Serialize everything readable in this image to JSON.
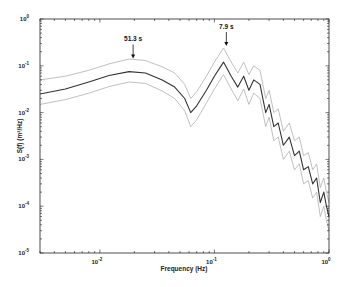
{
  "chart_data": {
    "type": "line",
    "title": "",
    "xlabel": "Frequency (Hz)",
    "ylabel": "S(f) (m²/Hz)",
    "xscale": "log",
    "yscale": "log",
    "xlim": [
      0.003,
      1
    ],
    "ylim": [
      1e-05,
      1
    ],
    "grid": false,
    "x_ticks": [
      {
        "value": 0.01,
        "base": "10",
        "exp": "-2"
      },
      {
        "value": 0.1,
        "base": "10",
        "exp": "-1"
      },
      {
        "value": 1,
        "base": "10",
        "exp": "0"
      }
    ],
    "y_ticks": [
      {
        "value": 1,
        "base": "10",
        "exp": "0"
      },
      {
        "value": 0.1,
        "base": "10",
        "exp": "-1"
      },
      {
        "value": 0.01,
        "base": "10",
        "exp": "-2"
      },
      {
        "value": 0.001,
        "base": "10",
        "exp": "-3"
      },
      {
        "value": 0.0001,
        "base": "10",
        "exp": "-4"
      },
      {
        "value": 1e-05,
        "base": "10",
        "exp": "-5"
      }
    ],
    "x": [
      0.003,
      0.005,
      0.008,
      0.012,
      0.018,
      0.025,
      0.035,
      0.045,
      0.055,
      0.062,
      0.07,
      0.085,
      0.1,
      0.12,
      0.14,
      0.16,
      0.18,
      0.2,
      0.22,
      0.25,
      0.28,
      0.3,
      0.33,
      0.36,
      0.4,
      0.45,
      0.5,
      0.55,
      0.6,
      0.66,
      0.72,
      0.78,
      0.84,
      0.9,
      0.95,
      1.0
    ],
    "series": [
      {
        "name": "Spectral estimate",
        "color": "#333333",
        "values": [
          0.025,
          0.032,
          0.045,
          0.062,
          0.075,
          0.07,
          0.05,
          0.035,
          0.02,
          0.01,
          0.014,
          0.03,
          0.06,
          0.12,
          0.06,
          0.035,
          0.06,
          0.03,
          0.05,
          0.04,
          0.01,
          0.015,
          0.005,
          0.006,
          0.002,
          0.003,
          0.0012,
          0.0015,
          0.0006,
          0.0007,
          0.0003,
          0.0004,
          0.00012,
          0.0002,
          0.0001,
          6e-05
        ]
      },
      {
        "name": "Upper confidence bound",
        "color": "#b0b0b0",
        "values": [
          0.05,
          0.06,
          0.08,
          0.11,
          0.14,
          0.13,
          0.095,
          0.07,
          0.04,
          0.02,
          0.028,
          0.06,
          0.12,
          0.24,
          0.12,
          0.07,
          0.12,
          0.065,
          0.1,
          0.08,
          0.02,
          0.03,
          0.01,
          0.012,
          0.004,
          0.006,
          0.0025,
          0.003,
          0.0012,
          0.0014,
          0.0006,
          0.0008,
          0.00025,
          0.0004,
          0.0002,
          0.00012
        ]
      },
      {
        "name": "Lower confidence bound",
        "color": "#b0b0b0",
        "values": [
          0.015,
          0.019,
          0.026,
          0.036,
          0.045,
          0.042,
          0.029,
          0.02,
          0.011,
          0.005,
          0.007,
          0.016,
          0.032,
          0.065,
          0.032,
          0.018,
          0.032,
          0.015,
          0.026,
          0.02,
          0.005,
          0.008,
          0.0025,
          0.003,
          0.001,
          0.0015,
          0.0006,
          0.0008,
          0.0003,
          0.00035,
          0.00015,
          0.0002,
          6e-05,
          0.0001,
          5e-05,
          3e-05
        ]
      }
    ],
    "annotations": [
      {
        "text": "51.3 s",
        "x": 0.0195,
        "y": 0.13,
        "arrow": "down"
      },
      {
        "text": "7.9 s",
        "x": 0.127,
        "y": 0.24,
        "arrow": "down"
      }
    ]
  }
}
